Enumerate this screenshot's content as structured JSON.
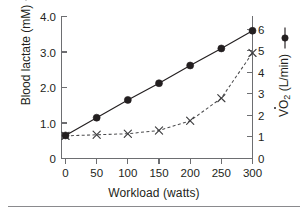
{
  "chart_data": {
    "type": "line",
    "title": "",
    "xlabel": "Workload (watts)",
    "x": [
      0,
      50,
      100,
      150,
      200,
      250,
      300
    ],
    "xtick_labels": [
      "0",
      "50",
      "100",
      "150",
      "200",
      "250",
      "300"
    ],
    "xlim": [
      -18,
      318
    ],
    "grid": false,
    "legend_position": "axis-titles",
    "series": [
      {
        "name": "Blood lactate (mM)",
        "axis": "left",
        "marker": "filled-circle",
        "linestyle": "solid",
        "color": "#231f20",
        "values": [
          0.65,
          1.15,
          1.65,
          2.12,
          2.62,
          3.1,
          3.6
        ]
      },
      {
        "name": "VO2 (L/min)",
        "axis": "right",
        "marker": "x",
        "linestyle": "dashed",
        "color": "#4d4d4f",
        "values": [
          1.05,
          1.1,
          1.15,
          1.3,
          1.75,
          2.8,
          4.9
        ]
      }
    ],
    "axes": {
      "left": {
        "label": "Blood lactate (mM)",
        "unit": "mM",
        "ylim": [
          0,
          4.0
        ],
        "ticks": [
          0,
          1.0,
          2.0,
          3.0,
          4.0
        ],
        "tick_labels": [
          "0",
          "1.0",
          "2.0",
          "3.0",
          "4.0"
        ],
        "legend_marker": "x-dashed"
      },
      "right": {
        "label": "VO2 (L/min)",
        "label_main": "VO",
        "label_sub": "2",
        "label_unit": "(L/min)",
        "unit": "L/min",
        "ylim": [
          0,
          6
        ],
        "ticks": [
          0,
          1,
          2,
          3,
          4,
          5,
          6
        ],
        "tick_labels": [
          "0",
          "1",
          "2",
          "3",
          "4",
          "5",
          "6"
        ],
        "legend_marker": "circle-solid"
      }
    }
  },
  "figure": {
    "x_axis_title": "Workload (watts)",
    "y_left_title": "Blood lactate (mM)",
    "y_right_title_main": "VO",
    "y_right_title_sub": "2",
    "y_right_title_unit": "(L/min)",
    "colors": {
      "axis": "#6d6e71",
      "lactate_series": "#231f20",
      "vo2_series": "#4d4d4f",
      "background": "#ffffff"
    }
  }
}
